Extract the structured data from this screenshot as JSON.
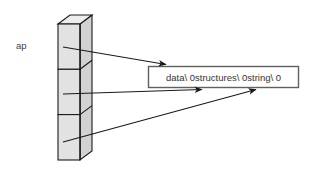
{
  "diagram": {
    "pointer_array": {
      "label": "ap",
      "cell_count": 3,
      "cells": [
        {
          "index": 0,
          "name": "ap[0]"
        },
        {
          "index": 1,
          "name": "ap[1]"
        },
        {
          "index": 2,
          "name": "ap[2]"
        }
      ]
    },
    "buffer": {
      "text": "data\\ 0structures\\ 0string\\ 0",
      "segments": [
        "data\\ 0",
        "structures\\ 0",
        "string\\ 0"
      ]
    },
    "arrows": [
      {
        "from": "ap[0]",
        "to": "buffer-segment-data"
      },
      {
        "from": "ap[1]",
        "to": "buffer-segment-structures"
      },
      {
        "from": "ap[2]",
        "to": "buffer-segment-string"
      }
    ],
    "colors": {
      "face_fill": "#e2e2e2",
      "top_fill": "#ededed",
      "side_fill": "#d2d2d2",
      "outline": "#1a1a1a",
      "box_border": "#606060",
      "arrow": "#1a1a1a",
      "text": "#333333",
      "label_text": "#444444",
      "background": "#ffffff"
    }
  }
}
